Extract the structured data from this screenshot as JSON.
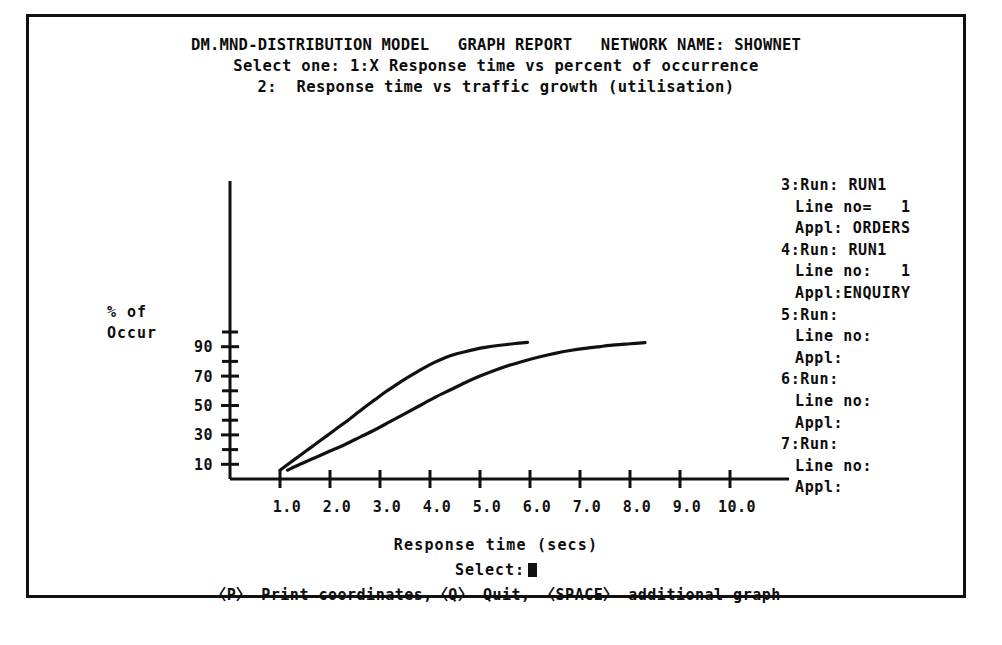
{
  "header": {
    "model_title": "DM.MND-DISTRIBUTION MODEL",
    "report_title": "GRAPH REPORT",
    "network_label": "NETWORK NAME: SHOWNET",
    "select_one_line": "Select one: 1:X Response time vs percent of occurrence",
    "option_two_line": "2:  Response time vs traffic growth (utilisation)"
  },
  "axes": {
    "y_label_line1": "% of",
    "y_label_line2": "Occur",
    "x_label": "Response time (secs)",
    "x_ticks": [
      "1.0",
      "2.0",
      "3.0",
      "4.0",
      "5.0",
      "6.0",
      "7.0",
      "8.0",
      "9.0",
      "10.0"
    ],
    "y_ticks": [
      "10",
      "30",
      "50",
      "70",
      "90"
    ]
  },
  "runs": [
    {
      "index": "3:",
      "run_label": "Run:",
      "run_value": "RUN1",
      "line_label": "Line no=",
      "line_value": "1",
      "appl_label": "Appl:",
      "appl_value": "ORDERS"
    },
    {
      "index": "4:",
      "run_label": "Run:",
      "run_value": "RUN1",
      "line_label": "Line no:",
      "line_value": "1",
      "appl_label": "Appl:",
      "appl_value": "ENQUIRY"
    },
    {
      "index": "5:",
      "run_label": "Run:",
      "run_value": "",
      "line_label": "Line no:",
      "line_value": "",
      "appl_label": "Appl:",
      "appl_value": ""
    },
    {
      "index": "6:",
      "run_label": "Run:",
      "run_value": "",
      "line_label": "Line no:",
      "line_value": "",
      "appl_label": "Appl:",
      "appl_value": ""
    },
    {
      "index": "7:",
      "run_label": "Run:",
      "run_value": "",
      "line_label": "Line no:",
      "line_value": "",
      "appl_label": "Appl:",
      "appl_value": ""
    }
  ],
  "prompt": {
    "select_label": "Select:",
    "cursor": "block-cursor",
    "commands": "〈P〉 Print coordinates,〈Q〉 Quit, 〈SPACE〉 additional graph"
  },
  "colors": {
    "ink": "#111111",
    "paper": "#ffffff"
  },
  "chart_data": {
    "type": "line",
    "title": "Response time vs percent of occurrence",
    "xlabel": "Response time (secs)",
    "ylabel": "% of Occur",
    "xlim": [
      0.0,
      10.5
    ],
    "ylim": [
      0,
      100
    ],
    "grid": false,
    "legend": "none",
    "x_tick_values": [
      1.0,
      2.0,
      3.0,
      4.0,
      5.0,
      6.0,
      7.0,
      8.0,
      9.0,
      10.0
    ],
    "y_tick_values": [
      10,
      30,
      50,
      70,
      90
    ],
    "y_minor_tick_values": [
      20,
      40,
      60,
      80,
      100
    ],
    "series": [
      {
        "name": "ORDERS",
        "run": "RUN1",
        "line_no": "1",
        "points": [
          [
            1.0,
            6.0
          ],
          [
            1.2,
            11.0
          ],
          [
            1.4,
            16.0
          ],
          [
            1.6,
            21.0
          ],
          [
            1.8,
            26.0
          ],
          [
            2.0,
            31.0
          ],
          [
            2.2,
            36.0
          ],
          [
            2.4,
            41.0
          ],
          [
            2.55,
            45.0
          ],
          [
            2.7,
            49.0
          ],
          [
            2.9,
            54.0
          ],
          [
            3.1,
            59.0
          ],
          [
            3.3,
            63.5
          ],
          [
            3.5,
            68.0
          ],
          [
            3.7,
            72.0
          ],
          [
            3.9,
            76.0
          ],
          [
            4.1,
            79.5
          ],
          [
            4.3,
            82.5
          ],
          [
            4.5,
            84.8
          ],
          [
            4.7,
            86.6
          ],
          [
            4.9,
            88.2
          ],
          [
            5.1,
            89.5
          ],
          [
            5.4,
            91.0
          ],
          [
            5.7,
            92.2
          ],
          [
            5.95,
            93.0
          ]
        ]
      },
      {
        "name": "ENQUIRY",
        "run": "RUN1",
        "line_no": "1",
        "points": [
          [
            1.15,
            6.0
          ],
          [
            1.4,
            10.0
          ],
          [
            1.7,
            14.5
          ],
          [
            2.0,
            19.0
          ],
          [
            2.3,
            23.5
          ],
          [
            2.6,
            28.5
          ],
          [
            2.9,
            33.5
          ],
          [
            3.2,
            39.0
          ],
          [
            3.5,
            44.5
          ],
          [
            3.8,
            50.0
          ],
          [
            4.1,
            55.5
          ],
          [
            4.4,
            60.5
          ],
          [
            4.7,
            65.5
          ],
          [
            5.0,
            70.0
          ],
          [
            5.3,
            74.0
          ],
          [
            5.6,
            77.5
          ],
          [
            5.9,
            80.5
          ],
          [
            6.2,
            83.2
          ],
          [
            6.5,
            85.5
          ],
          [
            6.8,
            87.4
          ],
          [
            7.1,
            88.9
          ],
          [
            7.4,
            90.1
          ],
          [
            7.7,
            91.2
          ],
          [
            8.0,
            92.0
          ],
          [
            8.3,
            92.8
          ]
        ]
      }
    ]
  }
}
